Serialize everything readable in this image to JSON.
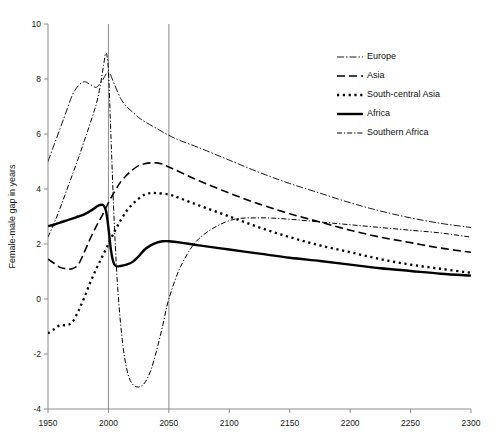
{
  "chart_data": {
    "type": "line",
    "title": "",
    "subtitle": "",
    "xlabel": "",
    "ylabel": "Female-male gap in years",
    "xlim": [
      1950,
      2300
    ],
    "ylim": [
      -4,
      10
    ],
    "xticks": [
      1950,
      2000,
      2050,
      2100,
      2150,
      2200,
      2250,
      2300
    ],
    "yticks": [
      -4,
      -2,
      0,
      2,
      4,
      6,
      8,
      10
    ],
    "xtick_labels": [
      "1950",
      "2000",
      "2050",
      "2100",
      "2150",
      "2200",
      "2250",
      "2300"
    ],
    "ytick_labels": [
      "-4",
      "-2",
      "0",
      "2",
      "4",
      "6",
      "8",
      "10"
    ],
    "grid": false,
    "legend_position": "top-right",
    "reference_lines": [
      {
        "name": "year-2000-line",
        "x": 2000,
        "orientation": "vertical"
      },
      {
        "name": "year-2050-line",
        "x": 2050,
        "orientation": "vertical"
      }
    ],
    "series": [
      {
        "name": "Europe",
        "style": "dash-dot-thin",
        "stroke_width": 0.9,
        "dash": "7,2,1.5,2",
        "x": [
          1950,
          1955,
          1960,
          1965,
          1970,
          1975,
          1980,
          1985,
          1990,
          1995,
          2000,
          2005,
          2010,
          2015,
          2020,
          2025,
          2030,
          2040,
          2050,
          2060,
          2075,
          2100,
          2125,
          2150,
          2175,
          2200,
          2225,
          2250,
          2275,
          2300
        ],
        "y": [
          5.0,
          5.6,
          6.2,
          6.8,
          7.4,
          7.75,
          7.9,
          7.8,
          7.7,
          7.95,
          8.25,
          7.8,
          7.3,
          7.0,
          6.8,
          6.6,
          6.45,
          6.2,
          5.95,
          5.75,
          5.5,
          5.05,
          4.6,
          4.2,
          3.85,
          3.5,
          3.2,
          2.95,
          2.75,
          2.6
        ]
      },
      {
        "name": "Asia",
        "style": "dashed",
        "stroke_width": 1.6,
        "dash": "8,4",
        "x": [
          1950,
          1955,
          1960,
          1965,
          1970,
          1975,
          1980,
          1985,
          1990,
          1995,
          2000,
          2005,
          2010,
          2015,
          2020,
          2025,
          2030,
          2035,
          2040,
          2045,
          2050,
          2060,
          2075,
          2100,
          2125,
          2150,
          2175,
          2200,
          2225,
          2250,
          2275,
          2300
        ],
        "y": [
          1.45,
          1.3,
          1.15,
          1.1,
          1.1,
          1.25,
          1.7,
          2.2,
          2.65,
          3.05,
          3.5,
          3.9,
          4.25,
          4.5,
          4.7,
          4.85,
          4.92,
          4.95,
          4.95,
          4.9,
          4.8,
          4.6,
          4.3,
          3.85,
          3.45,
          3.1,
          2.8,
          2.5,
          2.25,
          2.05,
          1.85,
          1.7
        ]
      },
      {
        "name": "South-central Asia",
        "style": "dotted",
        "stroke_width": 2.3,
        "dash": "2.2,3.6",
        "x": [
          1950,
          1955,
          1960,
          1965,
          1970,
          1975,
          1980,
          1985,
          1990,
          1995,
          2000,
          2005,
          2010,
          2015,
          2020,
          2025,
          2030,
          2035,
          2040,
          2050,
          2060,
          2075,
          2100,
          2125,
          2150,
          2175,
          2200,
          2225,
          2250,
          2275,
          2300
        ],
        "y": [
          -1.25,
          -1.1,
          -0.95,
          -0.95,
          -0.85,
          -0.45,
          0.05,
          0.6,
          1.1,
          1.55,
          2.0,
          2.45,
          2.85,
          3.2,
          3.45,
          3.65,
          3.8,
          3.85,
          3.85,
          3.8,
          3.65,
          3.4,
          3.0,
          2.6,
          2.25,
          1.95,
          1.7,
          1.45,
          1.25,
          1.1,
          0.95
        ]
      },
      {
        "name": "Africa",
        "style": "solid",
        "stroke_width": 2.4,
        "dash": "",
        "x": [
          1950,
          1955,
          1960,
          1965,
          1970,
          1975,
          1980,
          1985,
          1990,
          1993,
          1996,
          1998,
          2000,
          2002,
          2004,
          2006,
          2010,
          2015,
          2020,
          2025,
          2030,
          2035,
          2040,
          2045,
          2050,
          2060,
          2075,
          2100,
          2125,
          2150,
          2175,
          2200,
          2225,
          2250,
          2275,
          2300
        ],
        "y": [
          2.65,
          2.7,
          2.78,
          2.85,
          2.92,
          3.0,
          3.08,
          3.2,
          3.35,
          3.42,
          3.4,
          3.2,
          2.6,
          1.8,
          1.35,
          1.2,
          1.2,
          1.25,
          1.35,
          1.55,
          1.8,
          1.95,
          2.05,
          2.1,
          2.1,
          2.05,
          1.95,
          1.8,
          1.65,
          1.5,
          1.38,
          1.25,
          1.12,
          1.02,
          0.92,
          0.85
        ]
      },
      {
        "name": "Southern Africa",
        "style": "dash-dot",
        "stroke_width": 1.0,
        "dash": "5,2,1.2,2",
        "x": [
          1950,
          1955,
          1960,
          1965,
          1970,
          1975,
          1980,
          1985,
          1990,
          1993,
          1996,
          1998,
          2000,
          2002,
          2005,
          2008,
          2012,
          2016,
          2020,
          2025,
          2030,
          2035,
          2040,
          2045,
          2050,
          2060,
          2075,
          2100,
          2125,
          2150,
          2175,
          2200,
          2225,
          2250,
          2275,
          2300
        ],
        "y": [
          2.25,
          2.75,
          3.3,
          3.9,
          4.5,
          5.1,
          5.75,
          6.4,
          7.1,
          7.7,
          8.5,
          8.95,
          8.3,
          6.0,
          2.6,
          0.2,
          -1.7,
          -2.7,
          -3.1,
          -3.2,
          -3.05,
          -2.6,
          -1.85,
          -0.95,
          0.0,
          1.2,
          2.2,
          2.85,
          2.95,
          2.9,
          2.8,
          2.7,
          2.6,
          2.5,
          2.4,
          2.25
        ]
      }
    ]
  },
  "legend": {
    "items": [
      {
        "label": "Europe",
        "series": "Europe"
      },
      {
        "label": "Asia",
        "series": "Asia"
      },
      {
        "label": "South-central Asia",
        "series": "South-central Asia"
      },
      {
        "label": "Africa",
        "series": "Africa"
      },
      {
        "label": "Southern Africa",
        "series": "Southern Africa"
      }
    ]
  }
}
